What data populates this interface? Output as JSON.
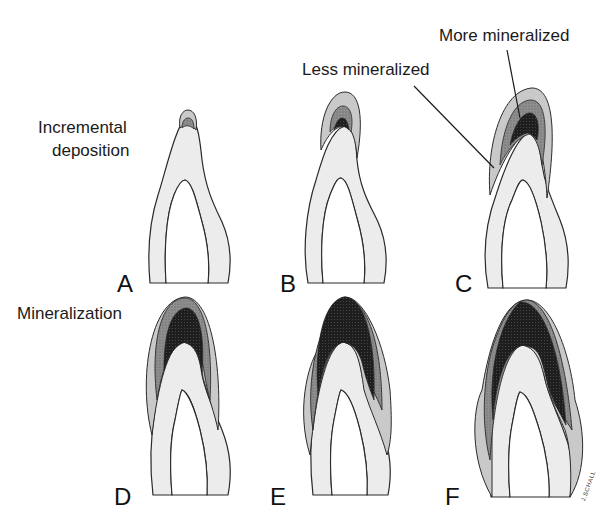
{
  "figure": {
    "annotations": {
      "incremental_deposition": [
        "Incremental",
        "deposition"
      ],
      "mineralization": "Mineralization",
      "less_mineralized": "Less mineralized",
      "more_mineralized": "More mineralized"
    },
    "panels": [
      {
        "letter": "A",
        "stage": "incremental deposition"
      },
      {
        "letter": "B",
        "stage": "incremental deposition"
      },
      {
        "letter": "C",
        "stage": "incremental deposition"
      },
      {
        "letter": "D",
        "stage": "mineralization"
      },
      {
        "letter": "E",
        "stage": "mineralization"
      },
      {
        "letter": "F",
        "stage": "mineralization"
      }
    ],
    "signature": "J.SCHALL",
    "colors": {
      "background": "#ffffff",
      "dentin": "#ececec",
      "less_mineralized": "#c9c9c9",
      "intermediate": "#8e8e8e",
      "more_mineralized": "#1e1e1e",
      "outline": "#2a2a2a"
    }
  }
}
